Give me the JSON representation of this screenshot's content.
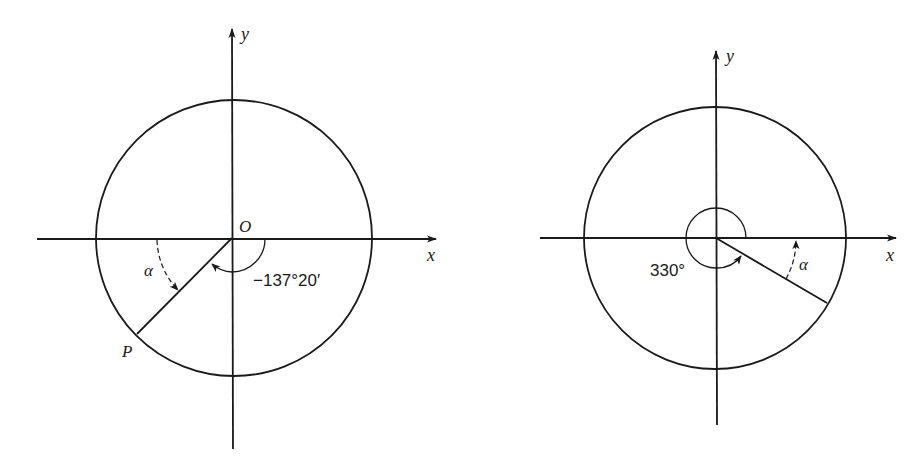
{
  "figures": [
    {
      "id": "left",
      "labels": {
        "y_axis": "y",
        "x_axis": "x",
        "origin": "O",
        "point": "P",
        "reference_angle": "α",
        "angle": "−137°20′"
      },
      "angle_degrees": -137.333,
      "reference_angle_degrees": 42.667
    },
    {
      "id": "right",
      "labels": {
        "y_axis": "y",
        "x_axis": "x",
        "reference_angle": "α",
        "angle": "330°"
      },
      "angle_degrees": 330,
      "reference_angle_degrees": 30
    }
  ],
  "colors": {
    "stroke": "#1a1a1a",
    "background": "#ffffff"
  }
}
